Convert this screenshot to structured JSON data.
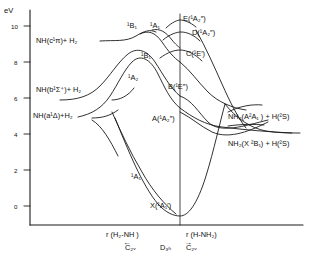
{
  "figure": {
    "type": "potential-energy-correlation-diagram",
    "y_axis": {
      "label": "eV",
      "ticks": [
        "0",
        "2",
        "4",
        "6",
        "8",
        "10"
      ],
      "range": [
        0,
        11
      ]
    },
    "x_axis": {
      "left_coordinate": "r (H₂-NH )",
      "left_symmetry": "C₂ᵥ",
      "center_symmetry": "D₃ₕ",
      "right_coordinate": "r (H-NH₂)",
      "right_symmetry": "C₂ᵥ"
    },
    "asymptote_labels_left": [
      "NH(c¹π)+ H₂",
      "NH(b¹Σ⁺)+ H₂",
      "NH(a¹Δ)+H₂"
    ],
    "asymptote_labels_right": [
      "NH₂(A²A₁ ) + H(²S)",
      "NH₂(X ²B₁) + H(²S)"
    ],
    "state_labels_d3h": [
      "E(¹A₂″)",
      "D(¹A₂″)",
      "C(¹E′)",
      "B(¹E″)",
      "A(¹A₂″)",
      "X(¹A₁′)"
    ],
    "curve_labels_c2v": [
      "¹B₁",
      "¹A₁",
      "¹B₁",
      "¹A₂",
      "¹A₁"
    ],
    "colors": {
      "line": "#1a1a1a",
      "background": "#ffffff",
      "text": "#111111"
    }
  }
}
